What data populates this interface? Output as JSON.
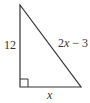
{
  "diagram": {
    "type": "right-triangle",
    "vertices": {
      "top": [
        20,
        5
      ],
      "right_angle": [
        20,
        87
      ],
      "bottom_right": [
        81,
        87
      ]
    },
    "right_angle_marker_size": 8,
    "stroke_color": "#333333",
    "labels": {
      "vertical_leg": "12",
      "hypotenuse": "2x − 3",
      "hypotenuse_var": "x",
      "hypotenuse_coef": "2",
      "hypotenuse_rest": " − 3",
      "horizontal_leg": "x"
    }
  }
}
